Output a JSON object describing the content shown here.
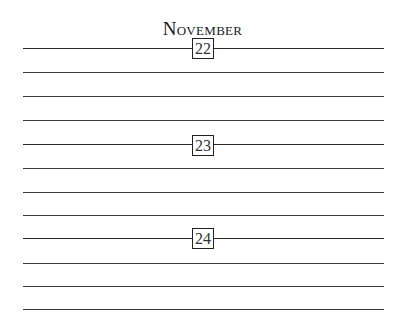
{
  "page": {
    "month": "November",
    "days": [
      {
        "number": "22"
      },
      {
        "number": "23"
      },
      {
        "number": "24"
      }
    ]
  },
  "colors": {
    "ink": "#1e1e1e",
    "background": "#ffffff"
  }
}
